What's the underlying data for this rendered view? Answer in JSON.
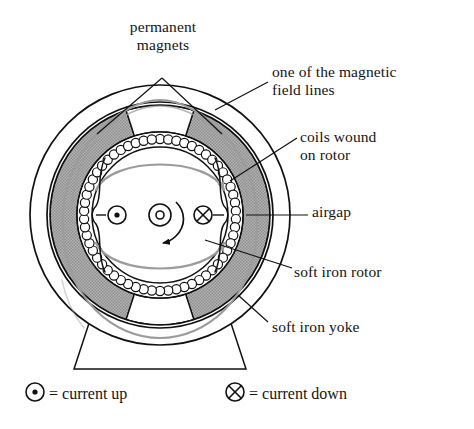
{
  "figure": {
    "type": "technical-diagram"
  },
  "labels": {
    "permanent_magnets": "permanent\nmagnets",
    "permanent_magnets_line1": "permanent",
    "permanent_magnets_line2": "magnets",
    "field_lines_line1": "one of the magnetic",
    "field_lines_line2": "field lines",
    "coils_line1": "coils wound",
    "coils_line2": "on rotor",
    "airgap": "airgap",
    "soft_iron_rotor": "soft iron rotor",
    "soft_iron_yoke": "soft iron yoke"
  },
  "legend": {
    "current_up_symbol": "dot-in-circle-icon",
    "current_up_text": "= current up",
    "current_down_symbol": "cross-in-circle-icon",
    "current_down_text": "= current down"
  },
  "symbols": {
    "shaft": "shaft-icon",
    "rotation_arrow": "rotation-direction-arrow",
    "current_up_marker": "current-up-marker",
    "current_down_marker": "current-down-marker"
  },
  "colors": {
    "outline": "#111111",
    "magnet_fill": "#a9a9a9",
    "field_line": "#9c9c9c",
    "background": "#ffffff",
    "coil_fill": "#ffffff"
  },
  "geometry": {
    "center_x": 160,
    "center_y": 215,
    "yoke_outer_radius": 130,
    "yoke_inner_radius": 113,
    "magnet_outer_radius": 110,
    "magnet_inner_radius": 83,
    "coil_ring_radius": 76,
    "rotor_radius": 68,
    "shaft_radius": 11,
    "magnet_count": 4,
    "coil_count": 58
  }
}
